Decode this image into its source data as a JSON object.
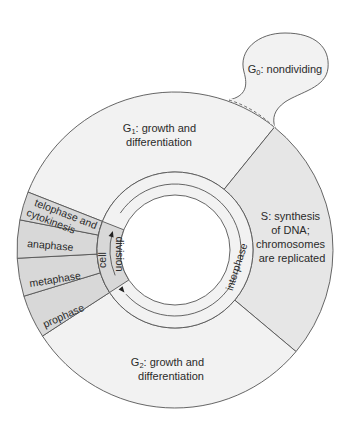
{
  "colors": {
    "interphase_fill": "#f2f2f2",
    "s_phase_fill": "#e6e6e6",
    "mitosis_fill": "#d8d8d8",
    "line": "#555555",
    "text": "#2a2a2a",
    "hole": "#ffffff"
  },
  "phases": {
    "g0": {
      "label_prefix": "G",
      "sub": "0",
      "label_rest": ": nondividing"
    },
    "g1": {
      "label_prefix": "G",
      "sub": "1",
      "line1_rest": ": growth and",
      "line2": "differentiation"
    },
    "s": {
      "lines": [
        "S: synthesis",
        "of DNA;",
        "chromosomes",
        "are replicated"
      ]
    },
    "g2": {
      "label_prefix": "G",
      "sub": "2",
      "line1_rest": ": growth and",
      "line2": "differentiation"
    },
    "mitosis": [
      {
        "lines": [
          "telophase and",
          "cytokinesis"
        ]
      },
      {
        "lines": [
          "anaphase"
        ]
      },
      {
        "lines": [
          "metaphase"
        ]
      },
      {
        "lines": [
          "prophase"
        ]
      }
    ]
  },
  "inner_ring": {
    "cell_division_line1": "cell",
    "cell_division_line2": "division",
    "interphase": "interphase"
  }
}
